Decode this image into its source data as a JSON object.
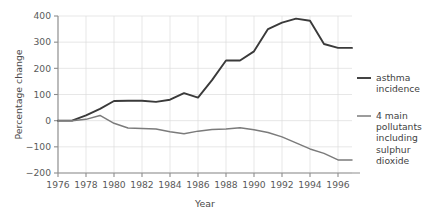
{
  "chart_data": {
    "type": "line",
    "title": "",
    "xlabel": "Year",
    "ylabel": "Percentage change",
    "xlim": [
      1976,
      1997
    ],
    "ylim": [
      -200,
      400
    ],
    "grid": true,
    "legend_position": "right",
    "x_ticks": [
      "1976",
      "1978",
      "1980",
      "1982",
      "1984",
      "1986",
      "1988",
      "1990",
      "1992",
      "1994",
      "1996"
    ],
    "y_ticks": [
      "400",
      "300",
      "200",
      "100",
      "0",
      "-100",
      "-200"
    ],
    "x": [
      1976,
      1977,
      1978,
      1979,
      1980,
      1981,
      1982,
      1983,
      1984,
      1985,
      1986,
      1987,
      1988,
      1989,
      1990,
      1991,
      1992,
      1993,
      1994,
      1995,
      1996,
      1997
    ],
    "series": [
      {
        "name": "asthma incidence",
        "color": "#3a3a3a",
        "width": 1.9,
        "values": [
          0,
          0,
          20,
          45,
          75,
          76,
          76,
          72,
          80,
          105,
          88,
          155,
          230,
          230,
          265,
          350,
          375,
          390,
          382,
          293,
          278,
          278
        ]
      },
      {
        "name": "4 main pollutants including sulphur dioxide",
        "color": "#7b7b7b",
        "width": 1.5,
        "values": [
          0,
          0,
          5,
          20,
          -10,
          -28,
          -30,
          -32,
          -42,
          -50,
          -40,
          -34,
          -32,
          -27,
          -35,
          -45,
          -62,
          -85,
          -108,
          -125,
          -150,
          -150
        ]
      }
    ],
    "legend": [
      {
        "lines": [
          "asthma",
          "incidence"
        ],
        "color": "#3a3a3a"
      },
      {
        "lines": [
          "4 main",
          "pollutants",
          "including",
          "sulphur",
          "dioxide"
        ],
        "color": "#7b7b7b"
      }
    ]
  },
  "geometry": {
    "plot_left": 58,
    "plot_right": 352,
    "plot_top": 16,
    "plot_bottom": 173
  }
}
